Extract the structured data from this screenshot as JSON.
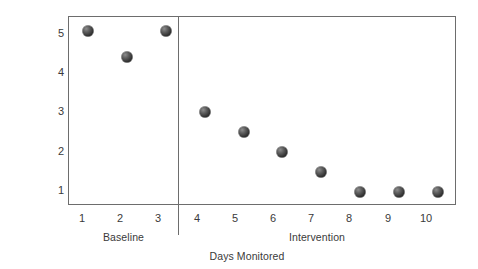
{
  "chart_data": {
    "type": "scatter",
    "title": "",
    "xlabel": "Days Monitored",
    "ylabel": "Behaviors",
    "x": [
      1,
      2,
      3,
      4,
      5,
      6,
      7,
      8,
      9,
      10
    ],
    "values": [
      5,
      4.35,
      5,
      3,
      2.5,
      2,
      1.5,
      1,
      1,
      1
    ],
    "series": [
      {
        "name": "Behaviors",
        "values": [
          5,
          4.35,
          5,
          3,
          2.5,
          2,
          1.5,
          1,
          1,
          1
        ]
      }
    ],
    "xlim": [
      0.5,
      10.5
    ],
    "ylim": [
      0.65,
      5.35
    ],
    "x_tick_labels": [
      "1",
      "2",
      "3",
      "4",
      "5",
      "6",
      "7",
      "8",
      "9",
      "10"
    ],
    "y_tick_labels": [
      "1",
      "2",
      "3",
      "4",
      "5"
    ],
    "y_ticks": [
      1,
      2,
      3,
      4,
      5
    ],
    "grid": false,
    "legend": false,
    "marker_color": "#333333",
    "frame_color": "#6d6d6d",
    "phases": [
      {
        "label": "Baseline",
        "days": [
          1,
          2,
          3
        ]
      },
      {
        "label": "Intervention",
        "days": [
          4,
          5,
          6,
          7,
          8,
          9,
          10
        ]
      }
    ],
    "annotations": [
      {
        "type": "phase-change-line",
        "x": 3.5
      }
    ]
  }
}
